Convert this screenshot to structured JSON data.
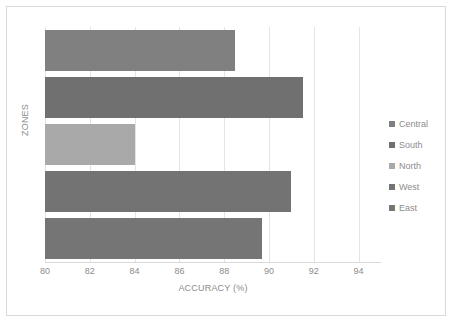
{
  "chart_data": {
    "type": "bar",
    "orientation": "horizontal",
    "title": "",
    "xlabel": "ACCURACY (%)",
    "ylabel": "ZONES",
    "xlim": [
      80,
      95
    ],
    "xticks": [
      80,
      82,
      84,
      86,
      88,
      90,
      92,
      94
    ],
    "xtick_labels": [
      "80",
      "82",
      "84",
      "86",
      "88",
      "90",
      "92",
      "94"
    ],
    "grid": true,
    "legend_position": "right",
    "categories": [
      "Central",
      "South",
      "North",
      "West",
      "East"
    ],
    "values": [
      88.5,
      91.5,
      84.0,
      91.0,
      89.7
    ],
    "series": [
      {
        "name": "Accuracy",
        "points": [
          {
            "category": "Central",
            "value": 88.5,
            "color": "#808080"
          },
          {
            "category": "South",
            "value": 91.5,
            "color": "#707070"
          },
          {
            "category": "North",
            "value": 84.0,
            "color": "#a9a9a9"
          },
          {
            "category": "West",
            "value": 91.0,
            "color": "#737373"
          },
          {
            "category": "East",
            "value": 89.7,
            "color": "#757575"
          }
        ]
      }
    ]
  },
  "legend": {
    "items": [
      {
        "label": "Central",
        "color": "#808080"
      },
      {
        "label": "South",
        "color": "#707070"
      },
      {
        "label": "North",
        "color": "#a9a9a9"
      },
      {
        "label": "West",
        "color": "#737373"
      },
      {
        "label": "East",
        "color": "#757575"
      }
    ]
  },
  "colors": {
    "frame_border": "#d9d9d9",
    "gridline": "#e4e4e4",
    "axis_text": "#8c8c8c",
    "background": "#ffffff"
  }
}
